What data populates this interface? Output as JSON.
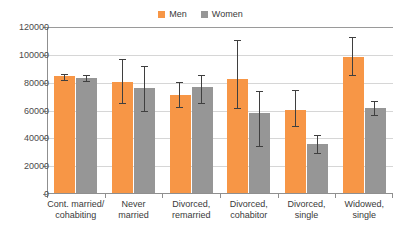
{
  "legend": {
    "position": "top-center",
    "entries": [
      {
        "label": "Men",
        "color": "#F79646",
        "icon": "square-swatch"
      },
      {
        "label": "Women",
        "color": "#969696",
        "icon": "square-swatch"
      }
    ]
  },
  "axis": {
    "y_ticks": [
      "0",
      "20000",
      "40000",
      "60000",
      "80000",
      "100000",
      "120000"
    ],
    "x_labels": [
      "Cont. married/\ncohabiting",
      "Never\nmarried",
      "Divorced,\nremarried",
      "Divorced,\ncohabitor",
      "Divorced,\nsingle",
      "Widowed,\nsingle"
    ]
  },
  "chart_data": {
    "type": "bar",
    "title": "",
    "subtitle": "",
    "xlabel": "",
    "ylabel": "",
    "ylim": [
      0,
      120000
    ],
    "ytick_step": 20000,
    "grid": true,
    "legend_position": "top-center",
    "error_bars": true,
    "categories": [
      "Cont. married/cohabiting",
      "Never married",
      "Divorced, remarried",
      "Divorced, cohabitor",
      "Divorced, single",
      "Widowed, single"
    ],
    "series": [
      {
        "name": "Men",
        "color": "#F79646",
        "values": [
          84000,
          80000,
          70500,
          82000,
          60000,
          98000
        ],
        "err_low": [
          81500,
          65000,
          61500,
          61000,
          48000,
          85000
        ],
        "err_high": [
          86500,
          97000,
          80500,
          111000,
          75000,
          113000
        ]
      },
      {
        "name": "Women",
        "color": "#969696",
        "values": [
          83000,
          75500,
          76000,
          57500,
          35500,
          61000
        ],
        "err_low": [
          80500,
          59000,
          64500,
          33500,
          28500,
          56000
        ],
        "err_high": [
          85500,
          92000,
          85500,
          74000,
          42500,
          66500
        ]
      }
    ]
  }
}
